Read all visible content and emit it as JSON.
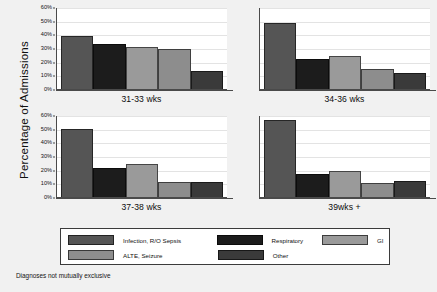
{
  "chart_data": {
    "type": "bar",
    "title": "",
    "xlabel": "",
    "ylabel": "Percentage of Admissions",
    "ylim": [
      0,
      60
    ],
    "ytick_labels": [
      "0%",
      "10%",
      "20%",
      "30%",
      "40%",
      "50%",
      "60%"
    ],
    "ytick_values": [
      0,
      10,
      20,
      30,
      40,
      50,
      60
    ],
    "grid": true,
    "legend_position": "bottom",
    "note": "Diagnoses not mutually exclusive",
    "panels": [
      {
        "label": "31-33 wks",
        "values": [
          39,
          33,
          31,
          29,
          13
        ]
      },
      {
        "label": "34-36 wks",
        "values": [
          48,
          22,
          24,
          15,
          12
        ]
      },
      {
        "label": "37-38 wks",
        "values": [
          50,
          21,
          24,
          11,
          11
        ]
      },
      {
        "label": "39wks +",
        "values": [
          56,
          17,
          19,
          10,
          12
        ]
      }
    ],
    "categories": [
      "Infection, R/O Sepsis",
      "Respiratory",
      "GI",
      "ALTE, Seizure",
      "Other"
    ],
    "series_colors": [
      "#555555",
      "#1c1c1c",
      "#9a9a9a",
      "#8d8d8d",
      "#3a3a3a"
    ]
  },
  "legend": {
    "rows": [
      [
        {
          "label": "Infection, R/O Sepsis",
          "color": "#555555"
        },
        {
          "label": "Respiratory",
          "color": "#1c1c1c"
        },
        {
          "label": "GI",
          "color": "#9a9a9a"
        }
      ],
      [
        {
          "label": "ALTE, Seizure",
          "color": "#8d8d8d"
        },
        {
          "label": "Other",
          "color": "#3a3a3a"
        },
        {
          "label": "",
          "color": ""
        }
      ]
    ]
  }
}
